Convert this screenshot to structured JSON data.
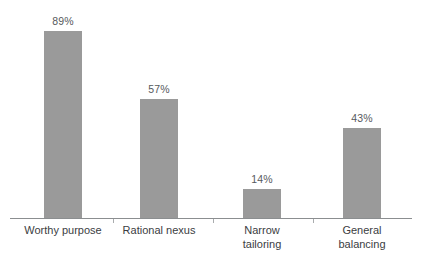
{
  "chart_data": {
    "type": "bar",
    "title": "",
    "subtitle": "",
    "xlabel": "",
    "ylabel": "",
    "ylim": [
      0,
      100
    ],
    "grid": false,
    "legend": false,
    "legend_position": "none",
    "categories": [
      "Worthy purpose",
      "Rational nexus",
      "Narrow\ntailoring",
      "General\nbalancing"
    ],
    "values": [
      89,
      57,
      14,
      43
    ],
    "value_labels": [
      "89%",
      "57%",
      "14%",
      "43%"
    ],
    "colors": {
      "bar_fill": "#9a9a9a",
      "axis_line": "#8b8e90",
      "tick": "#a9acae",
      "value_text": "#56595c",
      "category_text": "#3b3d3f",
      "background": "#ffffff"
    }
  },
  "axis": {
    "ticks": [
      "",
      "",
      ""
    ]
  }
}
